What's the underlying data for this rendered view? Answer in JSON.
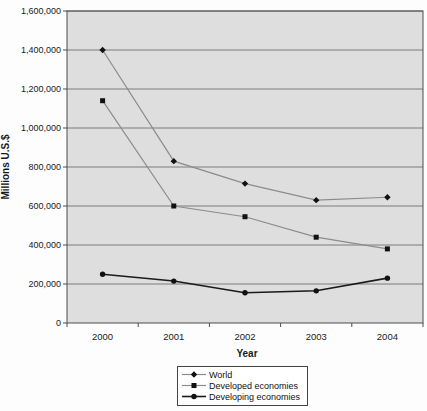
{
  "figure": {
    "y_axis_title": "Millions U.S.$",
    "x_axis_title": "Year"
  },
  "chart_data": {
    "type": "line",
    "title": "",
    "xlabel": "Year",
    "ylabel": "Millions U.S.$",
    "x": [
      "2000",
      "2001",
      "2002",
      "2003",
      "2004"
    ],
    "series": [
      {
        "name": "World",
        "marker": "diamond",
        "line_color": "#8c8c8c",
        "line_width": 1.2,
        "values": [
          1400000,
          830000,
          715000,
          630000,
          645000
        ]
      },
      {
        "name": "Developed economies",
        "marker": "square",
        "line_color": "#8c8c8c",
        "line_width": 1.2,
        "values": [
          1140000,
          600000,
          545000,
          440000,
          380000
        ]
      },
      {
        "name": "Developing economies",
        "marker": "circle",
        "line_color": "#1a1a1a",
        "line_width": 1.6,
        "values": [
          250000,
          215000,
          155000,
          165000,
          230000
        ]
      }
    ],
    "ylim": [
      0,
      1600000
    ],
    "ytick_step": 200000,
    "ytick_labels": [
      "0",
      "200,000",
      "400,000",
      "600,000",
      "800,000",
      "1,000,000",
      "1,200,000",
      "1,400,000",
      "1,600,000"
    ],
    "grid": true,
    "legend_position": "bottom"
  },
  "colors": {
    "plot_background": "#dedede",
    "plot_border": "#4d4d4d",
    "gridline": "#707070",
    "marker": "#111111",
    "text": "#1a1a1a",
    "page_background": "#fdfdfd"
  }
}
